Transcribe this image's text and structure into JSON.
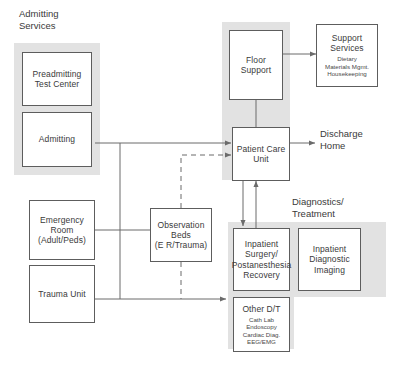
{
  "diagram": {
    "title_headings": [
      {
        "id": "admitting-services",
        "text": "Admitting\nServices"
      },
      {
        "id": "diagnostics-treatment",
        "text": "Diagnostics/\nTreatment"
      }
    ],
    "nodes": [
      {
        "id": "preadmitting-test-center",
        "main": "Preadmitting\nTest Center",
        "sub": ""
      },
      {
        "id": "admitting",
        "main": "Admitting",
        "sub": ""
      },
      {
        "id": "floor-support",
        "main": "Floor\nSupport",
        "sub": ""
      },
      {
        "id": "support-services",
        "main": "Support\nServices",
        "sub": "Dietary\nMaterials Mgmt.\nHousekeeping"
      },
      {
        "id": "patient-care-unit",
        "main": "Patient Care\nUnit",
        "sub": ""
      },
      {
        "id": "emergency-room",
        "main": "Emergency\nRoom\n(Adult/Peds)",
        "sub": ""
      },
      {
        "id": "trauma-unit",
        "main": "Trauma Unit",
        "sub": ""
      },
      {
        "id": "observation-beds",
        "main": "Observation\nBeds\n(E R/Trauma)",
        "sub": ""
      },
      {
        "id": "inpatient-surgery",
        "main": "Inpatient\nSurgery/\nPostanesthesia\nRecovery",
        "sub": ""
      },
      {
        "id": "inpatient-diagnostic-imaging",
        "main": "Inpatient\nDiagnostic\nImaging",
        "sub": ""
      },
      {
        "id": "other-dt",
        "main": "Other D/T",
        "sub": "Cath Lab\nEndoscopy\nCardiac Diag.\nEEG/EMG"
      }
    ],
    "terminals": [
      {
        "id": "discharge-home",
        "text": "Discharge\nHome"
      }
    ],
    "colors": {
      "panel_fill": "#e2e2e2",
      "node_border": "#5d5d5d",
      "line": "#6b6b6b",
      "text": "#3a3a3a",
      "background": "#ffffff"
    }
  }
}
